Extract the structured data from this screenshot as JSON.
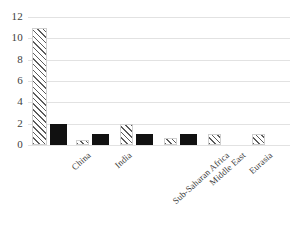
{
  "chart_data": {
    "type": "bar",
    "title": "",
    "subtitle": "",
    "xlabel": "",
    "ylabel": "",
    "ylim": [
      0,
      12
    ],
    "ytick_labels": [
      "12",
      "10",
      "8",
      "6",
      "4",
      "2",
      "0"
    ],
    "ytick_values": [
      12,
      10,
      8,
      6,
      4,
      2,
      0
    ],
    "grid": true,
    "legend": "none",
    "legend_entries": [],
    "categories": [
      "China",
      "India",
      "Sub-Saharan Africa",
      "Middle East",
      "Eurasia",
      "Latin America"
    ],
    "series": [
      {
        "name": "series-hatched",
        "style": "diagonal-hatch",
        "values": [
          11,
          0.5,
          2,
          0.7,
          1,
          1
        ]
      },
      {
        "name": "series-solid",
        "style": "solid-black",
        "values": [
          2,
          1,
          1,
          1,
          0,
          0
        ]
      }
    ],
    "colors": {
      "background": "#ffffff",
      "gridline": "#e2e2e2",
      "hatch_stroke": "#5c5c5c",
      "solid_fill": "#111111",
      "tick_text": "#404040",
      "label_text": "#3d3d3d"
    }
  }
}
